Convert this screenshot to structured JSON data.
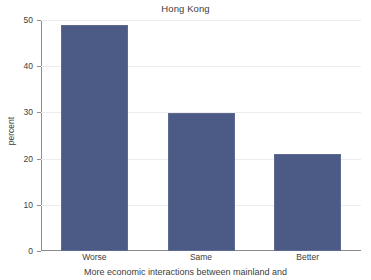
{
  "chart_data": {
    "type": "bar",
    "title": "Hong Kong",
    "xlabel": "More economic interactions between mainland and",
    "ylabel": "percent",
    "categories": [
      "Worse",
      "Same",
      "Better"
    ],
    "values": [
      49,
      29.8,
      21
    ],
    "ylim": [
      0,
      50
    ],
    "yticks": [
      0,
      10,
      20,
      30,
      40,
      50
    ],
    "ytick_labels": [
      "0",
      "10",
      "20",
      "30",
      "40",
      "50"
    ],
    "grid": "horizontal",
    "legend": "none",
    "series": [
      {
        "name": "percent",
        "values": [
          49,
          29.8,
          21
        ]
      }
    ],
    "colors": {
      "bar": "#4c5b85",
      "bar_edge": "#5d6b91",
      "grid": "#ececf0",
      "axis": "#8d8d8d",
      "text": "#3d3d3d",
      "background": "#ffffff"
    }
  }
}
